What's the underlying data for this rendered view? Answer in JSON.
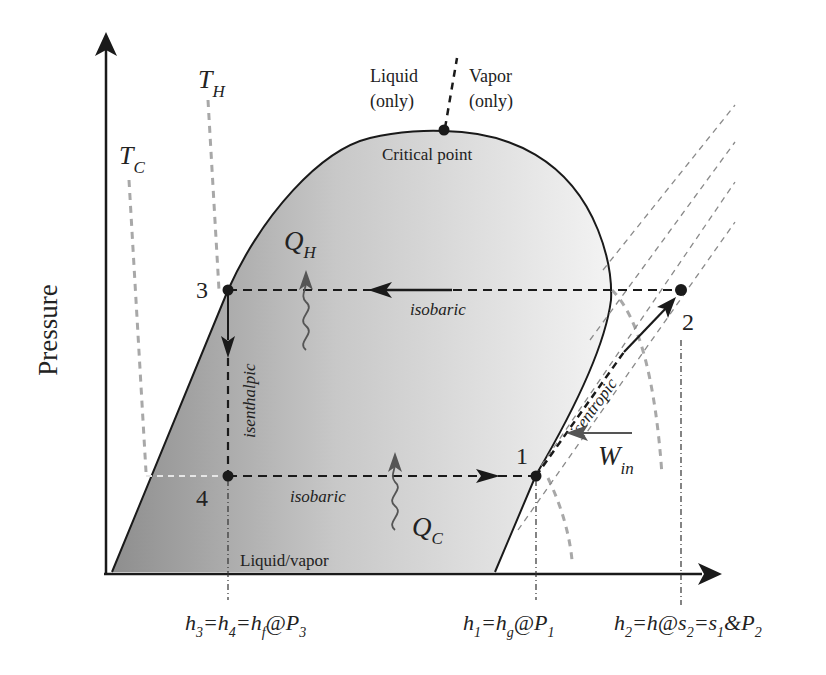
{
  "diagram": {
    "type": "P-h diagram of vapor-compression refrigeration cycle",
    "y_axis_label": "Pressure",
    "region_labels": {
      "liquid_only": [
        "Liquid",
        "(only)"
      ],
      "vapor_only": [
        "Vapor",
        "(only)"
      ],
      "critical_point": "Critical point",
      "liquid_vapor": "Liquid/vapor"
    },
    "temperatures": {
      "T_H": {
        "main": "T",
        "sub": "H"
      },
      "T_C": {
        "main": "T",
        "sub": "C"
      }
    },
    "states": [
      {
        "id": "1",
        "label": "1"
      },
      {
        "id": "2",
        "label": "2"
      },
      {
        "id": "3",
        "label": "3"
      },
      {
        "id": "4",
        "label": "4"
      }
    ],
    "processes": {
      "condensation": "isobaric",
      "evaporation": "isobaric",
      "expansion": "isenthalpic",
      "compression": "isentropic"
    },
    "heat_work": {
      "Q_H": {
        "main": "Q",
        "sub": "H"
      },
      "Q_C": {
        "main": "Q",
        "sub": "C"
      },
      "W_in": {
        "main": "W",
        "sub": "in"
      }
    },
    "enthalpy_labels": {
      "h34": {
        "parts": [
          [
            "h",
            "3"
          ],
          [
            "=h",
            "4"
          ],
          [
            "=h",
            "f"
          ],
          [
            "@P",
            "3"
          ]
        ]
      },
      "h1": {
        "parts": [
          [
            "h",
            "1"
          ],
          [
            "=h",
            "g"
          ],
          [
            "@P",
            "1"
          ]
        ]
      },
      "h2": {
        "parts": [
          [
            "h",
            "2"
          ],
          [
            "=h@s",
            "2"
          ],
          [
            "=s",
            "1"
          ],
          [
            "&P",
            "2"
          ]
        ]
      }
    },
    "colors": {
      "dome_dark": "#8c8c8c",
      "dome_light": "#f2f2f2",
      "line": "#1a1a1a",
      "isotherm": "#a8a8a8",
      "arrow_heat": "#555555"
    }
  }
}
